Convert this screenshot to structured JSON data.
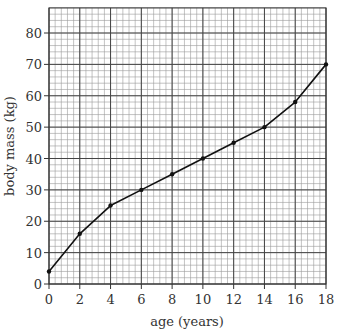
{
  "chart_data": {
    "type": "line",
    "title": "",
    "xlabel": "age (years)",
    "ylabel": "body mass (kg)",
    "xlim": [
      0,
      18
    ],
    "ylim": [
      0,
      88
    ],
    "x_ticks": [
      0,
      2,
      4,
      6,
      8,
      10,
      12,
      14,
      16,
      18
    ],
    "y_ticks": [
      0,
      10,
      20,
      30,
      40,
      50,
      60,
      70,
      80
    ],
    "grid": true,
    "legend": null,
    "series": [
      {
        "name": "body mass",
        "x": [
          0,
          2,
          4,
          6,
          8,
          10,
          12,
          14,
          16,
          18
        ],
        "y": [
          4,
          16,
          25,
          30,
          35,
          40,
          45,
          50,
          58,
          70
        ],
        "color": "#111111",
        "markers": true
      }
    ]
  },
  "labels": {
    "xlabel": "age (years)",
    "ylabel": "body mass (kg)"
  }
}
